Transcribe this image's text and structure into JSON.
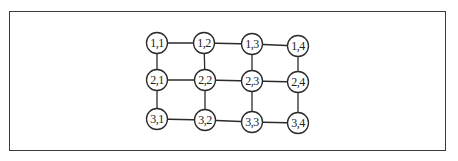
{
  "diagram": {
    "type": "grid-graph",
    "rows": 3,
    "cols": 4,
    "nodes": [
      {
        "id": "1,1",
        "label": "1,1",
        "x": 157,
        "y": 43
      },
      {
        "id": "1,2",
        "label": "1,2",
        "x": 204,
        "y": 43
      },
      {
        "id": "1,3",
        "label": "1,3",
        "x": 252,
        "y": 44
      },
      {
        "id": "1,4",
        "label": "1,4",
        "x": 298,
        "y": 46
      },
      {
        "id": "2,1",
        "label": "2,1",
        "x": 157,
        "y": 80
      },
      {
        "id": "2,2",
        "label": "2,2",
        "x": 205,
        "y": 80
      },
      {
        "id": "2,3",
        "label": "2,3",
        "x": 252,
        "y": 81
      },
      {
        "id": "2,4",
        "label": "2,4",
        "x": 298,
        "y": 82
      },
      {
        "id": "3,1",
        "label": "3,1",
        "x": 157,
        "y": 119
      },
      {
        "id": "3,2",
        "label": "3,2",
        "x": 205,
        "y": 120
      },
      {
        "id": "3,3",
        "label": "3,3",
        "x": 252,
        "y": 122
      },
      {
        "id": "3,4",
        "label": "3,4",
        "x": 298,
        "y": 123
      }
    ],
    "edges": [
      [
        "1,1",
        "1,2"
      ],
      [
        "1,2",
        "1,3"
      ],
      [
        "1,3",
        "1,4"
      ],
      [
        "2,1",
        "2,2"
      ],
      [
        "2,2",
        "2,3"
      ],
      [
        "2,3",
        "2,4"
      ],
      [
        "3,1",
        "3,2"
      ],
      [
        "3,2",
        "3,3"
      ],
      [
        "3,3",
        "3,4"
      ],
      [
        "1,1",
        "2,1"
      ],
      [
        "2,1",
        "3,1"
      ],
      [
        "1,2",
        "2,2"
      ],
      [
        "2,2",
        "3,2"
      ],
      [
        "1,3",
        "2,3"
      ],
      [
        "2,3",
        "3,3"
      ],
      [
        "1,4",
        "2,4"
      ],
      [
        "2,4",
        "3,4"
      ]
    ],
    "node_radius": 10.5,
    "colors": {
      "stroke": "#2a2a2a",
      "fill": "#ffffff",
      "border": "#3a3a3a"
    }
  }
}
